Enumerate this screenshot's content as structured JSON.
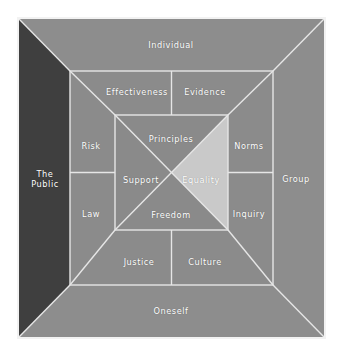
{
  "diagram": {
    "type": "nested-square-quadrant-diagram",
    "colors": {
      "page_background": "#ffffff",
      "frame_border": "#f2f2f2",
      "outer_ring": "#8d8d8d",
      "outer_ring_left_dark": "#3f3f3f",
      "middle_ring": "#8b8b8b",
      "inner_square": "#8a8a8a",
      "highlight_equality": "#c9c9c9",
      "divider_line": "#e6e6e6",
      "label_text": "#ffffff"
    },
    "rings": {
      "outer": {
        "name": "outer-ring",
        "segments": [
          {
            "id": "outer-top",
            "label": "Individual",
            "position": "top"
          },
          {
            "id": "outer-right",
            "label": "Group",
            "position": "right"
          },
          {
            "id": "outer-bottom",
            "label": "Oneself",
            "position": "bottom"
          },
          {
            "id": "outer-left",
            "label": "The Public",
            "position": "left",
            "highlighted": true
          }
        ]
      },
      "middle": {
        "name": "middle-ring",
        "segments": [
          {
            "id": "middle-top-left",
            "label": "Effectiveness",
            "position": "top-left"
          },
          {
            "id": "middle-top-right",
            "label": "Evidence",
            "position": "top-right"
          },
          {
            "id": "middle-right-top",
            "label": "Norms",
            "position": "right-top"
          },
          {
            "id": "middle-right-bottom",
            "label": "Inquiry",
            "position": "right-bottom"
          },
          {
            "id": "middle-bottom-right",
            "label": "Culture",
            "position": "bottom-right"
          },
          {
            "id": "middle-bottom-left",
            "label": "Justice",
            "position": "bottom-left"
          },
          {
            "id": "middle-left-bottom",
            "label": "Law",
            "position": "left-bottom"
          },
          {
            "id": "middle-left-top",
            "label": "Risk",
            "position": "left-top"
          }
        ]
      },
      "inner": {
        "name": "inner-square",
        "segments": [
          {
            "id": "inner-top",
            "label": "Principles",
            "position": "top"
          },
          {
            "id": "inner-right",
            "label": "Equality",
            "position": "right",
            "highlighted": true
          },
          {
            "id": "inner-bottom",
            "label": "Freedom",
            "position": "bottom"
          },
          {
            "id": "inner-left",
            "label": "Support",
            "position": "left"
          }
        ]
      }
    }
  }
}
